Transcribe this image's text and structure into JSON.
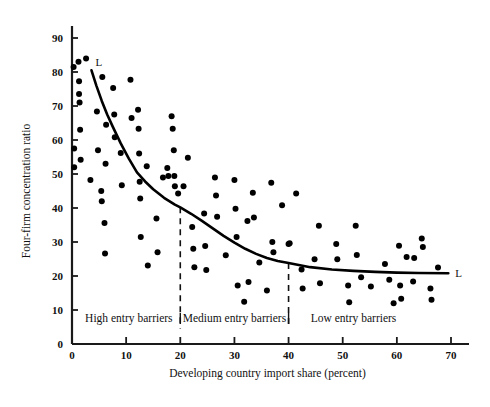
{
  "chart_data": {
    "type": "scatter",
    "title": "",
    "xlabel": "Developing country import share (percent)",
    "ylabel": "Four-firm concentration ratio",
    "xlim": [
      0,
      72
    ],
    "ylim": [
      0,
      95
    ],
    "xticks": [
      0,
      10,
      20,
      30,
      40,
      50,
      60,
      70
    ],
    "xticklabels": [
      "0",
      "10",
      "20",
      "30",
      "40",
      "50",
      "60",
      "70"
    ],
    "yticks": [
      0,
      10,
      20,
      30,
      40,
      50,
      60,
      70,
      80,
      90
    ],
    "yticklabels": [
      "0",
      "10",
      "20",
      "30",
      "40",
      "50",
      "60",
      "70",
      "80",
      "90"
    ],
    "grid": false,
    "legend": null,
    "marker_color": "#000000",
    "curve_color": "#000000",
    "points": [
      [
        0.3,
        81.5
      ],
      [
        0.4,
        57.5
      ],
      [
        0.4,
        52.0
      ],
      [
        1.2,
        83.0
      ],
      [
        1.3,
        77.3
      ],
      [
        1.3,
        73.5
      ],
      [
        1.4,
        71.0
      ],
      [
        1.5,
        63.0
      ],
      [
        1.6,
        54.2
      ],
      [
        2.6,
        84.0
      ],
      [
        3.4,
        48.2
      ],
      [
        4.6,
        68.4
      ],
      [
        4.8,
        57.0
      ],
      [
        5.4,
        45.0
      ],
      [
        5.5,
        42.0
      ],
      [
        5.6,
        78.5
      ],
      [
        6.0,
        35.6
      ],
      [
        6.1,
        26.6
      ],
      [
        6.2,
        53.0
      ],
      [
        6.3,
        64.5
      ],
      [
        7.6,
        75.3
      ],
      [
        7.8,
        67.5
      ],
      [
        7.9,
        60.8
      ],
      [
        9.0,
        56.2
      ],
      [
        9.2,
        46.7
      ],
      [
        10.8,
        77.7
      ],
      [
        11.0,
        66.5
      ],
      [
        12.2,
        68.9
      ],
      [
        12.3,
        63.3
      ],
      [
        12.4,
        56.0
      ],
      [
        12.5,
        47.7
      ],
      [
        12.6,
        42.8
      ],
      [
        12.7,
        31.5
      ],
      [
        13.8,
        52.3
      ],
      [
        14.0,
        23.1
      ],
      [
        15.6,
        36.9
      ],
      [
        15.8,
        27.0
      ],
      [
        16.8,
        49.0
      ],
      [
        17.6,
        51.8
      ],
      [
        17.8,
        49.4
      ],
      [
        18.4,
        67.0
      ],
      [
        18.6,
        63.3
      ],
      [
        18.8,
        57.0
      ],
      [
        18.9,
        49.4
      ],
      [
        19.0,
        46.4
      ],
      [
        19.6,
        44.3
      ],
      [
        20.6,
        46.4
      ],
      [
        21.4,
        54.8
      ],
      [
        22.2,
        34.4
      ],
      [
        22.4,
        28.0
      ],
      [
        22.6,
        22.6
      ],
      [
        24.4,
        38.4
      ],
      [
        24.6,
        28.8
      ],
      [
        24.8,
        21.8
      ],
      [
        26.4,
        49.0
      ],
      [
        26.6,
        43.7
      ],
      [
        26.8,
        37.4
      ],
      [
        28.4,
        26.1
      ],
      [
        30.0,
        48.2
      ],
      [
        30.2,
        39.8
      ],
      [
        30.4,
        31.5
      ],
      [
        30.6,
        17.2
      ],
      [
        31.8,
        12.4
      ],
      [
        32.4,
        36.2
      ],
      [
        32.6,
        18.2
      ],
      [
        33.4,
        44.5
      ],
      [
        33.6,
        37.2
      ],
      [
        34.6,
        24.0
      ],
      [
        36.0,
        15.7
      ],
      [
        36.8,
        47.4
      ],
      [
        37.0,
        30.0
      ],
      [
        37.2,
        27.0
      ],
      [
        38.8,
        40.8
      ],
      [
        40.0,
        29.4
      ],
      [
        40.2,
        29.6
      ],
      [
        41.4,
        44.3
      ],
      [
        42.4,
        21.9
      ],
      [
        42.6,
        16.3
      ],
      [
        44.8,
        24.9
      ],
      [
        45.6,
        34.8
      ],
      [
        45.8,
        17.9
      ],
      [
        48.8,
        29.4
      ],
      [
        49.0,
        24.9
      ],
      [
        51.0,
        17.2
      ],
      [
        51.2,
        12.3
      ],
      [
        52.4,
        34.8
      ],
      [
        52.6,
        26.2
      ],
      [
        53.4,
        19.6
      ],
      [
        55.2,
        16.9
      ],
      [
        57.8,
        23.5
      ],
      [
        58.6,
        18.9
      ],
      [
        59.4,
        12.0
      ],
      [
        60.4,
        28.9
      ],
      [
        60.6,
        17.2
      ],
      [
        60.8,
        13.3
      ],
      [
        61.8,
        25.6
      ],
      [
        63.0,
        18.4
      ],
      [
        63.2,
        25.3
      ],
      [
        64.6,
        31.0
      ],
      [
        64.8,
        28.5
      ],
      [
        66.2,
        16.3
      ],
      [
        66.4,
        13.0
      ],
      [
        67.6,
        22.5
      ]
    ],
    "curve_label_left": "L",
    "curve_label_right": "L",
    "curve_points": [
      [
        3.6,
        80.5
      ],
      [
        4.5,
        76.0
      ],
      [
        5.5,
        71.5
      ],
      [
        6.5,
        67.5
      ],
      [
        7.5,
        64.0
      ],
      [
        9.0,
        59.0
      ],
      [
        10.5,
        54.5
      ],
      [
        12.0,
        50.5
      ],
      [
        13.5,
        47.8
      ],
      [
        15.0,
        45.5
      ],
      [
        17.0,
        43.0
      ],
      [
        19.0,
        41.0
      ],
      [
        20.0,
        40.2
      ],
      [
        22.0,
        38.3
      ],
      [
        24.0,
        36.2
      ],
      [
        26.0,
        34.0
      ],
      [
        28.0,
        31.8
      ],
      [
        30.0,
        29.8
      ],
      [
        32.0,
        28.0
      ],
      [
        34.0,
        26.5
      ],
      [
        36.0,
        25.3
      ],
      [
        38.0,
        24.4
      ],
      [
        40.0,
        23.8
      ],
      [
        44.0,
        22.6
      ],
      [
        48.0,
        21.9
      ],
      [
        52.0,
        21.5
      ],
      [
        56.0,
        21.2
      ],
      [
        60.0,
        21.0
      ],
      [
        64.0,
        20.9
      ],
      [
        69.5,
        20.8
      ]
    ],
    "dividers": [
      {
        "x": 20,
        "y_top": 40.2,
        "y_bottom": 4.5
      },
      {
        "x": 40,
        "y_top": 23.8,
        "y_bottom": 4.5
      }
    ],
    "regions": [
      {
        "label": "High entry barriers",
        "x_center": 10.5,
        "x_start": 0,
        "x_end": 20
      },
      {
        "label": "Medium entry barriers",
        "x_center": 30.0,
        "x_start": 20,
        "x_end": 40
      },
      {
        "label": "Low entry barriers",
        "x_center": 52.0,
        "x_start": 40,
        "x_end": 70
      }
    ],
    "region_label_y": 6.5
  }
}
